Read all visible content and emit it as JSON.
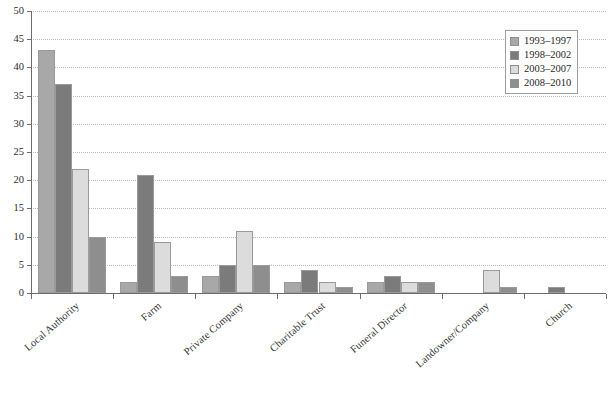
{
  "chart_data": {
    "type": "bar",
    "title": "",
    "subtitle": "",
    "xlabel": "",
    "ylabel": "",
    "ylim": [
      0,
      50
    ],
    "ytick_step": 5,
    "yticks": [
      0,
      5,
      10,
      15,
      20,
      25,
      30,
      35,
      40,
      45,
      50
    ],
    "grid": true,
    "grid_style": "dotted-horizontal",
    "legend_position": "top-right",
    "categories": [
      "Local Authority",
      "Farm",
      "Private Company",
      "Charitable Trust",
      "Funeral Director",
      "Landowner/Company",
      "Church"
    ],
    "series": [
      {
        "name": "1993–1997",
        "color": "#a8a8a8",
        "values": [
          43,
          2,
          3,
          2,
          2,
          0,
          0
        ]
      },
      {
        "name": "1998–2002",
        "color": "#7b7b7b",
        "values": [
          37,
          21,
          5,
          4,
          3,
          0,
          1
        ]
      },
      {
        "name": "2003–2007",
        "color": "#dcdcdc",
        "values": [
          22,
          9,
          11,
          2,
          2,
          4,
          0
        ]
      },
      {
        "name": "2008–2010",
        "color": "#8e8e8e",
        "values": [
          10,
          3,
          5,
          1,
          2,
          1,
          0
        ]
      }
    ]
  },
  "axes": {
    "y_tick_labels": [
      "0",
      "5",
      "10",
      "15",
      "20",
      "25",
      "30",
      "35",
      "40",
      "45",
      "50"
    ],
    "axis_color": "#6d6d6d",
    "grid_color": "#b9b9b9"
  },
  "legend": {
    "entries": [
      {
        "label": "1993–1997",
        "color": "#a8a8a8"
      },
      {
        "label": "1998–2002",
        "color": "#7b7b7b"
      },
      {
        "label": "2003–2007",
        "color": "#dcdcdc"
      },
      {
        "label": "2008–2010",
        "color": "#8e8e8e"
      }
    ]
  }
}
